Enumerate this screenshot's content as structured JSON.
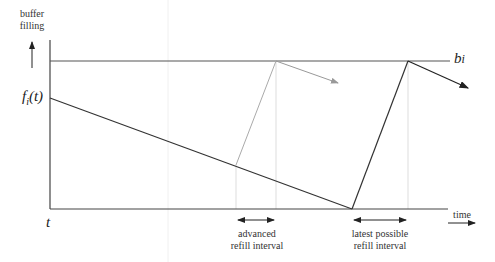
{
  "labels": {
    "y_axis_line1": "buffer",
    "y_axis_line2": "filling",
    "f_label": "f",
    "f_sub": "i",
    "f_arg": "(t)",
    "t_label": "t",
    "b_label": "b",
    "b_sub": "i",
    "time_label": "time",
    "advanced_line1": "advanced",
    "advanced_line2": "refill interval",
    "latest_line1": "latest possible",
    "latest_line2": "refill interval"
  },
  "colors": {
    "dark_line": "#333333",
    "light_line": "#aaaaaa",
    "guide_line": "#dddddd"
  }
}
